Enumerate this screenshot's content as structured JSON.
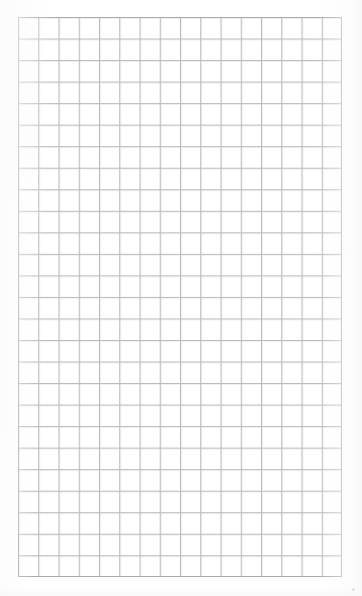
{
  "document": {
    "kind": "grid-paper",
    "title": "Blank graph paper sheet",
    "text_content": "",
    "visible_labels": []
  },
  "canvas": {
    "width_px": 362,
    "height_px": 596,
    "background_color": "#ffffff"
  },
  "grid": {
    "columns": 16,
    "rows": 26,
    "cell_width_px": 20.25,
    "cell_height_px": 21.54,
    "origin_x_px": 18,
    "origin_y_px": 17,
    "width_px": 324,
    "height_px": 560,
    "line_color": "#b9b9be",
    "line_width_px": 1,
    "frame_color": "#aaaaaf",
    "frame_width_px": 1,
    "ghost_line_color": "#dedee2"
  },
  "scan": {
    "speck_x_px": 352,
    "speck_y_px": 588,
    "edge_tint_color": "#f7f7f8"
  }
}
